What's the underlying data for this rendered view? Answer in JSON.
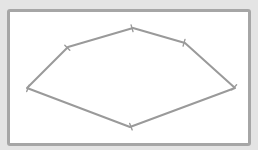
{
  "canvas": {
    "width": 258,
    "height": 150,
    "background_color": "#e4e4e4",
    "panel_color": "#ffffff",
    "panel_border_color": "#a6a6a6"
  },
  "shape": {
    "type": "polygon",
    "stroke_color": "#9a9a9a",
    "stroke_width": 2,
    "vertices": [
      {
        "id": "v1",
        "x": 27,
        "y": 88
      },
      {
        "id": "v2",
        "x": 68,
        "y": 47
      },
      {
        "id": "v3",
        "x": 133,
        "y": 28
      },
      {
        "id": "v4",
        "x": 185,
        "y": 43
      },
      {
        "id": "v5",
        "x": 235,
        "y": 88
      },
      {
        "id": "v6",
        "x": 130,
        "y": 127
      }
    ]
  }
}
